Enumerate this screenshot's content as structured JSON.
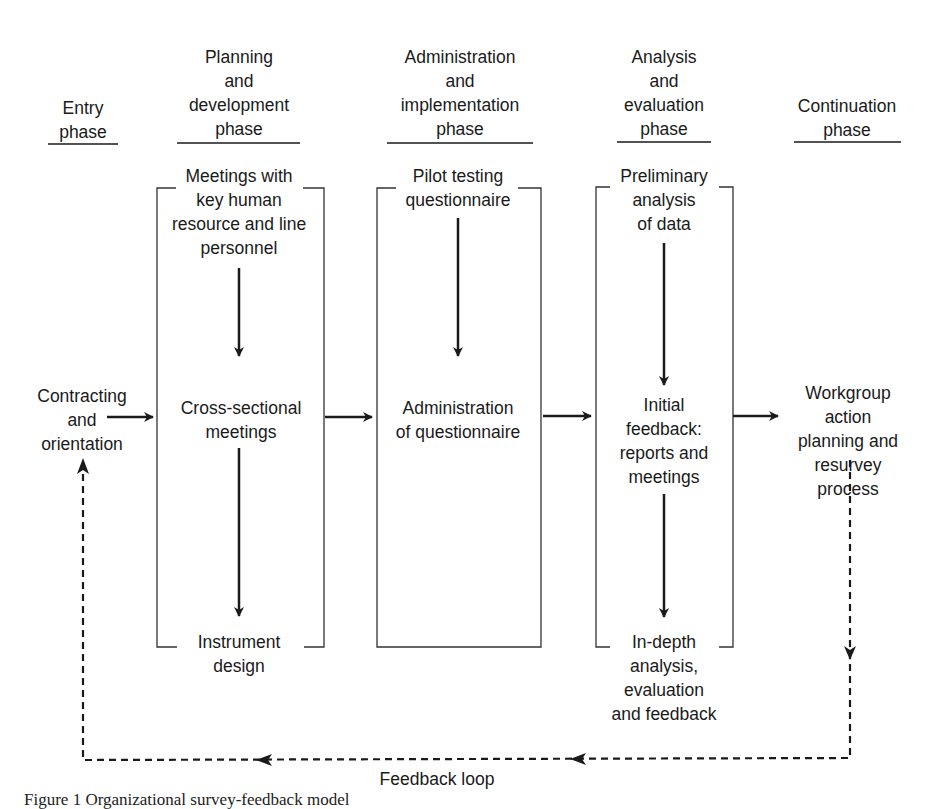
{
  "diagram": {
    "type": "flowchart",
    "phases": [
      {
        "id": "entry",
        "label": "Entry\nphase"
      },
      {
        "id": "planning",
        "label": "Planning\nand\ndevelopment\nphase"
      },
      {
        "id": "administration",
        "label": "Administration\nand\nimplementation\nphase"
      },
      {
        "id": "analysis",
        "label": "Analysis\nand\nevaluation\nphase"
      },
      {
        "id": "continuation",
        "label": "Continuation\nphase"
      }
    ],
    "nodes": {
      "contracting": "Contracting\nand\norientation",
      "meetings_key": "Meetings with\nkey human\nresource and line\npersonnel",
      "cross_sectional": "Cross-sectional\nmeetings",
      "instrument_design": "Instrument\ndesign",
      "pilot_testing": "Pilot testing\nquestionnaire",
      "administration_q": "Administration\nof questionnaire",
      "preliminary": "Preliminary\nanalysis\nof data",
      "initial_feedback": "Initial\nfeedback:\nreports and\nmeetings",
      "in_depth": "In-depth\nanalysis,\nevaluation\nand feedback",
      "workgroup": "Workgroup action\nplanning and\nresurvey process"
    },
    "edges": [
      {
        "from": "contracting",
        "to": "planning",
        "style": "solid"
      },
      {
        "from": "meetings_key",
        "to": "cross_sectional",
        "style": "solid"
      },
      {
        "from": "cross_sectional",
        "to": "instrument_design",
        "style": "solid"
      },
      {
        "from": "planning",
        "to": "administration",
        "style": "solid"
      },
      {
        "from": "pilot_testing",
        "to": "administration_q",
        "style": "solid"
      },
      {
        "from": "administration",
        "to": "analysis",
        "style": "solid"
      },
      {
        "from": "preliminary",
        "to": "initial_feedback",
        "style": "solid"
      },
      {
        "from": "initial_feedback",
        "to": "in_depth",
        "style": "solid"
      },
      {
        "from": "analysis",
        "to": "workgroup",
        "style": "solid"
      },
      {
        "from": "workgroup",
        "to": "contracting",
        "style": "dashed",
        "label": "Feedback loop"
      }
    ],
    "feedback_label": "Feedback loop",
    "caption": "Figure 1 Organizational survey-feedback model"
  },
  "colors": {
    "line": "#1a1a1a",
    "background": "#ffffff"
  }
}
